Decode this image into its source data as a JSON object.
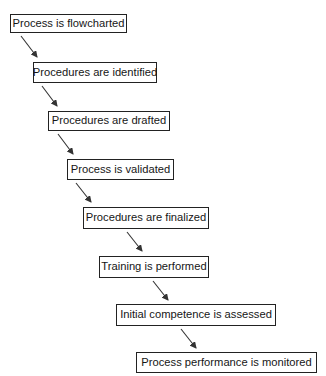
{
  "diagram": {
    "title": "",
    "steps": [
      {
        "label": "Process is flowcharted"
      },
      {
        "label": "Procedures are identified"
      },
      {
        "label": "Procedures are drafted"
      },
      {
        "label": "Process is validated"
      },
      {
        "label": "Procedures are finalized"
      },
      {
        "label": "Training is performed"
      },
      {
        "label": "Initial competence is assessed"
      },
      {
        "label": "Process performance is monitored"
      }
    ],
    "colors": {
      "box_border": "#222222",
      "arrow": "#333333",
      "background": "#ffffff"
    }
  }
}
